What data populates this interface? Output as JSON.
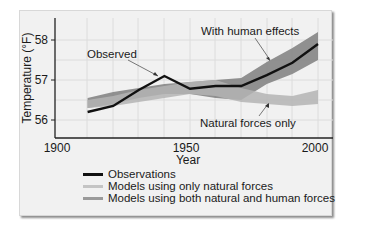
{
  "chart_data": {
    "type": "line",
    "title": "",
    "xlabel": "Year",
    "ylabel": "Temperature (°F)",
    "xlim": [
      1900,
      2010
    ],
    "ylim": [
      55.6,
      58.4
    ],
    "x_ticks": [
      "1900",
      "1950",
      "2000"
    ],
    "y_ticks": [
      "56",
      "57",
      "58"
    ],
    "grid": true,
    "x": [
      1910,
      1920,
      1930,
      1940,
      1950,
      1960,
      1970,
      1980,
      1990,
      2000
    ],
    "series": [
      {
        "name": "Observations",
        "type": "line",
        "color": "#111111",
        "values": [
          56.2,
          56.35,
          56.75,
          57.1,
          56.78,
          56.85,
          56.85,
          57.12,
          57.43,
          57.9
        ]
      },
      {
        "name": "Models using only natural forces",
        "type": "band",
        "color": "#b4b4b4",
        "upper": [
          56.5,
          56.6,
          56.75,
          56.85,
          56.95,
          57.0,
          56.8,
          56.65,
          56.6,
          56.75
        ],
        "lower": [
          56.3,
          56.35,
          56.45,
          56.55,
          56.65,
          56.6,
          56.45,
          56.4,
          56.35,
          56.4
        ]
      },
      {
        "name": "Models using both natural and human forces",
        "type": "band",
        "color": "#8a8a8a",
        "upper": [
          56.55,
          56.7,
          56.8,
          56.9,
          56.95,
          57.0,
          57.05,
          57.45,
          57.8,
          58.2
        ],
        "lower": [
          56.3,
          56.4,
          56.55,
          56.65,
          56.65,
          56.55,
          56.5,
          56.9,
          57.15,
          57.5
        ]
      }
    ],
    "annotations": [
      "Observed",
      "With human effects",
      "Natural forces only"
    ],
    "legend_position": "bottom",
    "legend": [
      "Observations",
      "Models using only natural forces",
      "Models using both natural and human forces"
    ]
  },
  "labels": {
    "xlabel": "Year",
    "ylabel": "Temperature (°F)",
    "xtick_1900": "1900",
    "xtick_1950": "1950",
    "xtick_2000": "2000",
    "ytick_56": "56",
    "ytick_57": "57",
    "ytick_58": "58",
    "annot_observed": "Observed",
    "annot_human": "With human effects",
    "annot_natural": "Natural forces only"
  },
  "legend": {
    "items": [
      {
        "label": "Observations",
        "color": "#111111"
      },
      {
        "label": "Models using only natural forces",
        "color": "#c4c4c4"
      },
      {
        "label": "Models using both natural and human forces",
        "color": "#9a9a9a"
      }
    ]
  }
}
